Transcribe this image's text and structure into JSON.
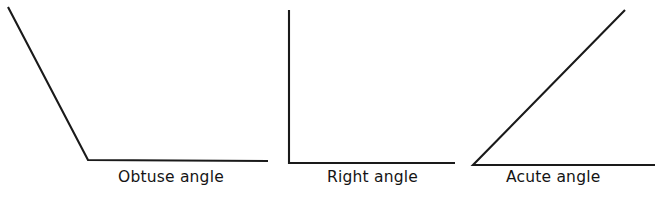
{
  "figure": {
    "width": 670,
    "height": 199,
    "background_color": "#ffffff",
    "stroke_color": "#1a1a1a",
    "text_color": "#141414",
    "stroke_width": 2.1
  },
  "captions": {
    "obtuse": "Obtuse angle",
    "right": "Right angle",
    "acute": "Acute angle"
  },
  "chart_data": {
    "type": "diagram",
    "title": "",
    "subtitle": "",
    "xlabel": "",
    "ylabel": "",
    "grid": false,
    "legend": "none",
    "items": [
      {
        "name": "Obtuse angle",
        "label": "Obtuse angle",
        "measure_degrees": 152,
        "vertex": [
          88,
          160
        ],
        "rays": [
          {
            "id": "obtuse-upper-ray",
            "from": [
              88,
              160
            ],
            "to": [
              8,
              7
            ]
          },
          {
            "id": "obtuse-base-ray",
            "from": [
              88,
              160
            ],
            "to": [
              268,
              161
            ]
          }
        ],
        "polyline": [
          [
            8,
            7
          ],
          [
            88,
            160
          ],
          [
            268,
            161
          ]
        ],
        "caption_position": [
          118,
          170
        ]
      },
      {
        "name": "Right angle",
        "label": "Right angle",
        "measure_degrees": 90,
        "vertex": [
          289,
          163
        ],
        "rays": [
          {
            "id": "right-vertical-ray",
            "from": [
              289,
              163
            ],
            "to": [
              289,
              10
            ]
          },
          {
            "id": "right-base-ray",
            "from": [
              289,
              163
            ],
            "to": [
              455,
              163
            ]
          }
        ],
        "polyline": [
          [
            289,
            10
          ],
          [
            289,
            163
          ],
          [
            455,
            163
          ]
        ],
        "caption_position": [
          327,
          170
        ]
      },
      {
        "name": "Acute angle",
        "label": "Acute angle",
        "measure_degrees": 45,
        "vertex": [
          473,
          165
        ],
        "rays": [
          {
            "id": "acute-upper-ray",
            "from": [
              473,
              165
            ],
            "to": [
              625,
              10
            ]
          },
          {
            "id": "acute-base-ray",
            "from": [
              473,
              165
            ],
            "to": [
              655,
              165
            ]
          }
        ],
        "polyline": [
          [
            625,
            10
          ],
          [
            473,
            165
          ],
          [
            655,
            165
          ]
        ],
        "caption_position": [
          506,
          170
        ]
      }
    ]
  }
}
